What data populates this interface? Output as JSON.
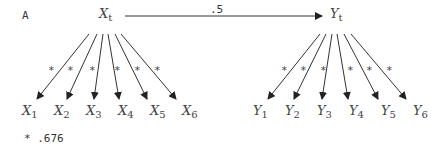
{
  "panel_label": "A",
  "path_coefficient": ".5",
  "footnote": "* .676",
  "latent": {
    "x": {
      "base": "X",
      "sub": "t"
    },
    "y": {
      "base": "Y",
      "sub": "t"
    }
  },
  "indicators": {
    "x": [
      {
        "base": "X",
        "sub": "1"
      },
      {
        "base": "X",
        "sub": "2"
      },
      {
        "base": "X",
        "sub": "3"
      },
      {
        "base": "X",
        "sub": "4"
      },
      {
        "base": "X",
        "sub": "5"
      },
      {
        "base": "X",
        "sub": "6"
      }
    ],
    "y": [
      {
        "base": "Y",
        "sub": "1"
      },
      {
        "base": "Y",
        "sub": "2"
      },
      {
        "base": "Y",
        "sub": "3"
      },
      {
        "base": "Y",
        "sub": "4"
      },
      {
        "base": "Y",
        "sub": "5"
      },
      {
        "base": "Y",
        "sub": "6"
      }
    ]
  },
  "loading_marker": "*",
  "colors": {
    "line": "#333333",
    "text": "#444444",
    "background": "#ffffff"
  }
}
